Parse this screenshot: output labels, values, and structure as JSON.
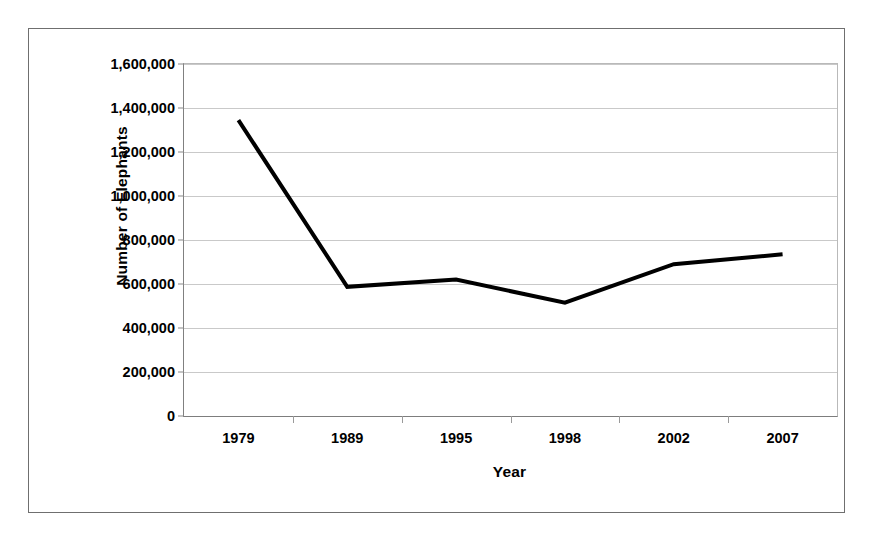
{
  "chart_data": {
    "type": "line",
    "title": "",
    "xlabel": "Year",
    "ylabel": "Number of Elephants",
    "categories": [
      "1979",
      "1989",
      "1995",
      "1998",
      "2002",
      "2007"
    ],
    "series": [
      {
        "name": "Number of Elephants",
        "values": [
          1345000,
          587000,
          620000,
          515000,
          690000,
          735000
        ]
      }
    ],
    "ylim": [
      0,
      1600000
    ],
    "ytick_values": [
      0,
      200000,
      400000,
      600000,
      800000,
      1000000,
      1200000,
      1400000,
      1600000
    ],
    "ytick_labels": [
      "0",
      "200,000",
      "400,000",
      "600,000",
      "800,000",
      "1,000,000",
      "1,200,000",
      "1,400,000",
      "1,600,000"
    ],
    "grid": true,
    "legend": "none",
    "line_color": "#000000",
    "line_width": 4,
    "markers": "none",
    "plot_background": "#ffffff",
    "gridline_color": "#c9c9c9",
    "border_color": "#6f6f6f"
  }
}
